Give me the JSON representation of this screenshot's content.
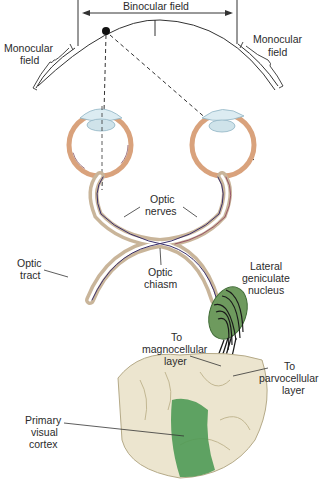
{
  "diagram": {
    "type": "anatomical-illustration",
    "colors": {
      "nerve_outer": "#c9b59a",
      "nerve_inner": "#ffffff",
      "nerve_purple": "#3a2f6b",
      "eye_sclera": "#d9a27c",
      "lens": "#cfe3ea",
      "lgn_green": "#5e8c4f",
      "cortex_green": "#4f9a55",
      "brain": "#ece5cf",
      "line": "#333333"
    }
  },
  "labels": {
    "binocular_field": "Binocular field",
    "monocular_left_1": "Monocular",
    "monocular_left_2": "field",
    "monocular_right_1": "Monocular",
    "monocular_right_2": "field",
    "optic_nerves_1": "Optic",
    "optic_nerves_2": "nerves",
    "optic_tract_1": "Optic",
    "optic_tract_2": "tract",
    "optic_chiasm_1": "Optic",
    "optic_chiasm_2": "chiasm",
    "lgn_1": "Lateral",
    "lgn_2": "geniculate",
    "lgn_3": "nucleus",
    "magno_1": "To",
    "magno_2": "magnocellular",
    "magno_3": "layer",
    "parvo_1": "To",
    "parvo_2": "parvocellular",
    "parvo_3": "layer",
    "v1_1": "Primary",
    "v1_2": "visual",
    "v1_3": "cortex"
  }
}
